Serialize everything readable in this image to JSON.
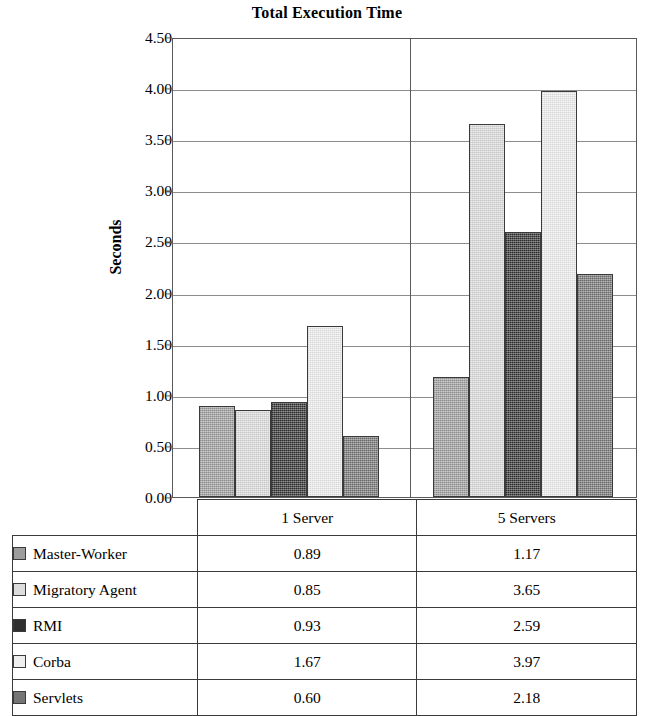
{
  "chart_data": {
    "type": "bar",
    "title": "Total Execution Time",
    "xlabel": "",
    "ylabel": "Seconds",
    "categories": [
      "1 Server",
      "5 Servers"
    ],
    "series": [
      {
        "name": "Master-Worker",
        "values": [
          0.89,
          1.17
        ],
        "color": "#9d9d9d"
      },
      {
        "name": "Migratory Agent",
        "values": [
          0.85,
          3.65
        ],
        "color": "#dcdcdc"
      },
      {
        "name": "RMI",
        "values": [
          0.93,
          2.59
        ],
        "color": "#2f2f2f"
      },
      {
        "name": "Corba",
        "values": [
          1.67,
          3.97
        ],
        "color": "#eeeeee"
      },
      {
        "name": "Servlets",
        "values": [
          0.6,
          2.18
        ],
        "color": "#757575"
      }
    ],
    "ylim": [
      0.0,
      4.5
    ],
    "ytick_labels": [
      "4.50",
      "4.00",
      "3.50",
      "3.00",
      "2.50",
      "2.00",
      "1.50",
      "1.00",
      "0.50",
      "0.00"
    ],
    "ytick_values": [
      4.5,
      4.0,
      3.5,
      3.0,
      2.5,
      2.0,
      1.5,
      1.0,
      0.5,
      0.0
    ],
    "grid": true,
    "legend_position": "bottom-table",
    "value_labels": [
      {
        "series": "Master-Worker",
        "1 Server": "0.89",
        "5 Servers": "1.17"
      },
      {
        "series": "Migratory Agent",
        "1 Server": "0.85",
        "5 Servers": "3.65"
      },
      {
        "series": "RMI",
        "1 Server": "0.93",
        "5 Servers": "2.59"
      },
      {
        "series": "Corba",
        "1 Server": "1.67",
        "5 Servers": "3.97"
      },
      {
        "series": "Servlets",
        "1 Server": "0.60",
        "5 Servers": "2.18"
      }
    ]
  },
  "table": {
    "category_headers": [
      "1 Server",
      "5 Servers"
    ],
    "rows": [
      {
        "label": "Master-Worker",
        "v1": "0.89",
        "v2": "1.17"
      },
      {
        "label": "Migratory Agent",
        "v1": "0.85",
        "v2": "3.65"
      },
      {
        "label": "RMI",
        "v1": "0.93",
        "v2": "2.59"
      },
      {
        "label": "Corba",
        "v1": "1.67",
        "v2": "3.97"
      },
      {
        "label": "Servlets",
        "v1": "0.60",
        "v2": "2.18"
      }
    ]
  }
}
